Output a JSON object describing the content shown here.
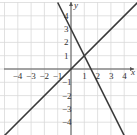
{
  "chart_data": {
    "type": "line",
    "title": "",
    "xlabel": "x",
    "ylabel": "y",
    "xlim": [
      -5,
      5
    ],
    "ylim": [
      -5,
      5
    ],
    "grid": true,
    "x_ticks": [
      -4,
      -3,
      -2,
      -1,
      1,
      2,
      3,
      4
    ],
    "y_ticks": [
      4,
      3,
      2,
      1,
      -1,
      -2,
      -3,
      -4
    ],
    "x_tick_labels": [
      "−4",
      "−3",
      "−2",
      "−1",
      "1",
      "2",
      "3",
      "4"
    ],
    "y_tick_labels": [
      "4",
      "3",
      "2",
      "1",
      "−1",
      "−2",
      "−3",
      "−4"
    ],
    "series": [
      {
        "name": "line-1",
        "equation": "y = x",
        "x": [
          -5,
          5
        ],
        "y": [
          -5,
          5
        ]
      },
      {
        "name": "line-2",
        "equation": "y = -2x + 3",
        "x": [
          -1,
          4
        ],
        "y": [
          5,
          -5
        ]
      }
    ],
    "intersection": {
      "x": 1,
      "y": 1
    },
    "colors": {
      "line": "#3a3a3a",
      "grid": "#d9d9d9",
      "axis": "#555555"
    }
  }
}
